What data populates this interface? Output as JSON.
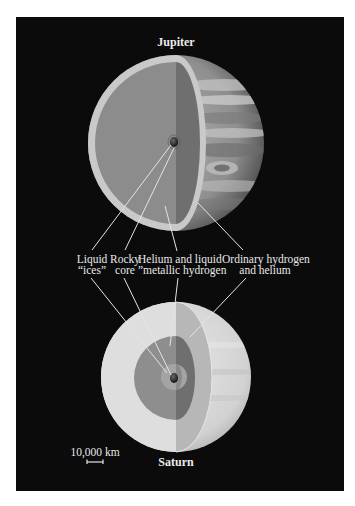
{
  "diagram": {
    "type": "cutaway-comparison",
    "planets": [
      {
        "name": "Jupiter",
        "label": "Jupiter"
      },
      {
        "name": "Saturn",
        "label": "Saturn"
      }
    ],
    "layers": [
      {
        "id": "liquid-ices",
        "line1": "Liquid",
        "line2": "“ices”"
      },
      {
        "id": "rocky-core",
        "line1": "Rocky",
        "line2": "core"
      },
      {
        "id": "helium-metallic-hydrogen",
        "line1": "Helium and liquid",
        "line2": "”metallic hydrogen"
      },
      {
        "id": "ordinary-hydrogen-helium",
        "line1": "Ordinary hydrogen",
        "line2": "and helium"
      }
    ],
    "scale": {
      "label": "10,000 km"
    }
  },
  "colors": {
    "background": "#0b0b0b",
    "page": "#ffffff",
    "label_text": "#e8e8e8",
    "jupiter_shell": "#c9c9c9",
    "jupiter_interior": "#8c8c8c",
    "jupiter_interior_dark": "#6f6f6f",
    "saturn_shell": "#dcdcdc",
    "saturn_mid": "#a6a6a6",
    "saturn_inner": "#8a8a8a",
    "core": "#1a1a1a"
  }
}
